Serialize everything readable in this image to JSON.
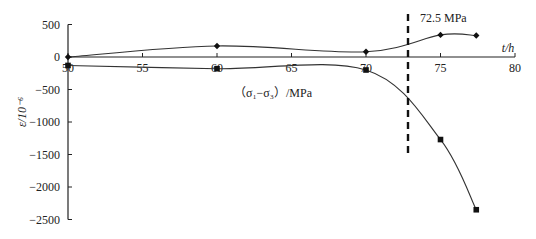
{
  "chart_data": {
    "type": "line",
    "title": "",
    "xlabel": "t/h",
    "ylabel": "ε/10⁻⁶",
    "xlim": [
      50,
      80
    ],
    "ylim": [
      -2500,
      500
    ],
    "x_ticks": [
      50,
      55,
      60,
      65,
      70,
      75,
      80
    ],
    "y_ticks": [
      500,
      0,
      -500,
      -1000,
      -1500,
      -2000,
      -2500
    ],
    "grid": false,
    "annotations": [
      {
        "text": "(σ1−σ3) /MPa",
        "position": "below x-axis, centered"
      },
      {
        "text": "72.5 MPa",
        "type": "vertical dashed line",
        "x": 72.7
      }
    ],
    "series": [
      {
        "name": "upper (diamond markers)",
        "marker": "diamond",
        "x": [
          50,
          60,
          70,
          75,
          77.4
        ],
        "values": [
          0,
          170,
          80,
          340,
          330
        ]
      },
      {
        "name": "lower (square markers)",
        "marker": "square",
        "x": [
          50,
          60,
          70,
          75,
          77.4
        ],
        "values": [
          -130,
          -180,
          -200,
          -1270,
          -2350
        ]
      }
    ]
  },
  "labels": {
    "y_axis_label": "ε/10⁻⁶",
    "x_axis_label": "t/h",
    "stress_label": "（σ₁−σ₃）/MPa",
    "threshold_label": "72.5 MPa",
    "y_tick_labels": [
      "500",
      "0",
      "−500",
      "−1000",
      "−1500",
      "−2000",
      "−2500"
    ],
    "x_tick_labels": [
      "50",
      "55",
      "60",
      "65",
      "70",
      "75",
      "80"
    ]
  }
}
